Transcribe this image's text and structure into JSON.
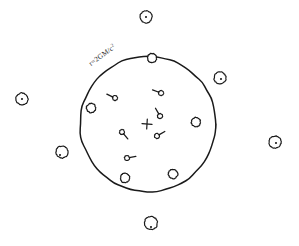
{
  "figure": {
    "background_color": "#ffffff",
    "ink_color": "#1a1a1a",
    "width": 299,
    "height": 246
  },
  "horizon": {
    "name": "event-horizon",
    "label_text": "r=2GM/c",
    "label_exponent": "2",
    "label_full": "r=2GM/c²",
    "label_rotation_deg": -36,
    "center_x": 148,
    "center_y": 124,
    "radius": 68,
    "stroke_width": 1.5
  },
  "singularity": {
    "name": "singularity-marker",
    "glyph": "cross",
    "x": 147,
    "y": 124,
    "size": 5
  },
  "infalling_particles": {
    "label": "infalling particles inside the horizon",
    "items": [
      {
        "id": "p1",
        "x": 115,
        "y": 98,
        "angle": 205,
        "length": 9
      },
      {
        "id": "p2",
        "x": 161,
        "y": 93,
        "angle": 200,
        "length": 9
      },
      {
        "id": "p3",
        "x": 160,
        "y": 116,
        "angle": 240,
        "length": 9
      },
      {
        "id": "p4",
        "x": 122,
        "y": 132,
        "angle": 50,
        "length": 9
      },
      {
        "id": "p5",
        "x": 157,
        "y": 136,
        "angle": 330,
        "length": 9
      },
      {
        "id": "p6",
        "x": 127,
        "y": 158,
        "angle": 350,
        "length": 9
      }
    ]
  },
  "horizon_particles": {
    "label": "particles frozen on the event horizon",
    "items": [
      {
        "id": "h1",
        "x": 152,
        "y": 58,
        "r": 4.6
      },
      {
        "id": "h2",
        "x": 91,
        "y": 108,
        "r": 4.6
      },
      {
        "id": "h3",
        "x": 196,
        "y": 122,
        "r": 4.6
      },
      {
        "id": "h4",
        "x": 125,
        "y": 178,
        "r": 4.6
      },
      {
        "id": "h5",
        "x": 173,
        "y": 174,
        "r": 4.6
      }
    ]
  },
  "escaped_particles": {
    "label": "distant particles outside the horizon",
    "items": [
      {
        "id": "e1",
        "x": 146,
        "y": 17,
        "r": 6.0,
        "dot_x": 146,
        "dot_y": 17
      },
      {
        "id": "e2",
        "x": 220,
        "y": 78,
        "r": 6.0,
        "dot_x": 221,
        "dot_y": 79
      },
      {
        "id": "e3",
        "x": 22,
        "y": 99,
        "r": 6.0,
        "dot_x": 22,
        "dot_y": 99
      },
      {
        "id": "e4",
        "x": 275,
        "y": 142,
        "r": 6.0,
        "dot_x": 276,
        "dot_y": 143
      },
      {
        "id": "e5",
        "x": 62,
        "y": 152,
        "r": 6.0,
        "dot_x": 60,
        "dot_y": 155
      },
      {
        "id": "e6",
        "x": 151,
        "y": 223,
        "r": 6.5,
        "dot_x": 151,
        "dot_y": 227
      }
    ]
  }
}
